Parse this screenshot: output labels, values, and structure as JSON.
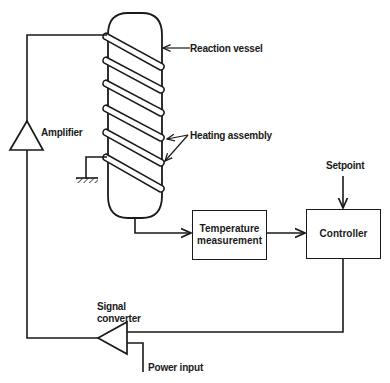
{
  "diagram": {
    "type": "block-diagram",
    "labels": {
      "reaction_vessel": "Reaction vessel",
      "heating_assembly": "Heating assembly",
      "amplifier": "Amplifier",
      "setpoint": "Setpoint",
      "signal_converter_line1": "Signal",
      "signal_converter_line2": "converter",
      "power_input": "Power input"
    },
    "blocks": {
      "temperature_measurement": {
        "line1": "Temperature",
        "line2": "measurement"
      },
      "controller": {
        "label": "Controller"
      }
    },
    "components": [
      "Reaction vessel",
      "Heating assembly (6 coil turns)",
      "Ground",
      "Amplifier",
      "Temperature measurement",
      "Controller",
      "Setpoint",
      "Signal converter",
      "Power input"
    ],
    "connections": [
      {
        "from": "Reaction vessel",
        "to": "Temperature measurement"
      },
      {
        "from": "Temperature measurement",
        "to": "Controller"
      },
      {
        "from": "Setpoint",
        "to": "Controller"
      },
      {
        "from": "Controller",
        "to": "Signal converter"
      },
      {
        "from": "Power input",
        "to": "Signal converter"
      },
      {
        "from": "Signal converter",
        "to": "Amplifier"
      },
      {
        "from": "Amplifier",
        "to": "Heating assembly"
      },
      {
        "from": "Heating assembly",
        "to": "Ground"
      }
    ],
    "colors": {
      "stroke": "#1a1a1a",
      "background": "#ffffff"
    }
  }
}
